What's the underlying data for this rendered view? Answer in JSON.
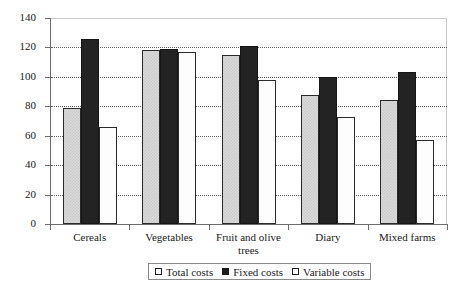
{
  "chart_data": {
    "type": "bar",
    "title": "",
    "xlabel": "",
    "ylabel": "",
    "ylim": [
      0,
      140
    ],
    "ytick_step": 20,
    "yticks": [
      0,
      20,
      40,
      60,
      80,
      100,
      120,
      140
    ],
    "grid": true,
    "grid_axis": "y",
    "legend_position": "bottom-center",
    "categories": [
      "Cereals",
      "Vegetables",
      "Fruit and olive trees",
      "Diary",
      "Mixed farms"
    ],
    "series": [
      {
        "name": "Total costs",
        "values": [
          79,
          118,
          115,
          88,
          84
        ],
        "color": "#d9d9d9",
        "pattern": "checkered"
      },
      {
        "name": "Fixed costs",
        "values": [
          126,
          119,
          121,
          100,
          103
        ],
        "color": "#232323",
        "pattern": "solid"
      },
      {
        "name": "Variable costs",
        "values": [
          66,
          117,
          98,
          73,
          57
        ],
        "color": "#ffffff",
        "pattern": "empty"
      }
    ]
  },
  "axis": {
    "y_tick_labels": [
      "0",
      "20",
      "40",
      "60",
      "80",
      "100",
      "120",
      "140"
    ],
    "x_tick_labels": [
      "Cereals",
      "Vegetables",
      "Fruit and olive trees",
      "Diary",
      "Mixed farms"
    ]
  },
  "legend": {
    "items": [
      {
        "label": "Total costs",
        "swatch": "square-outline-light"
      },
      {
        "label": "Fixed costs",
        "swatch": "square-filled-black"
      },
      {
        "label": "Variable costs",
        "swatch": "square-outline-white"
      }
    ]
  },
  "colors": {
    "total": "#d9d9d9",
    "fixed": "#232323",
    "variable": "#ffffff",
    "axis": "#6d6d6d",
    "grid": "#5d5d5d",
    "text": "#1a1a1a",
    "frame": "#c9c9c9"
  }
}
